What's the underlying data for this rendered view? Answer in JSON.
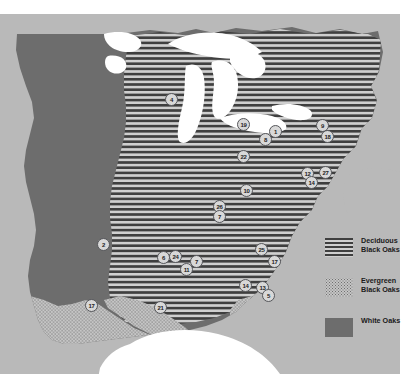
{
  "figure": {
    "type": "distribution-map",
    "region": "Eastern United States",
    "background_color": "#b9b9b9",
    "land_color": "#6d6d6d",
    "lake_color": "#ffffff"
  },
  "legend": {
    "items": [
      {
        "label_line1": "Deciduous",
        "label_line2": "Black Oaks",
        "pattern": "horizontal-stripes",
        "color": "#3f3f3f"
      },
      {
        "label_line1": "Evergreen",
        "label_line2": "Black Oaks",
        "pattern": "stipple-dots",
        "color": "#c4c4c4"
      },
      {
        "label_line1": "White Oaks",
        "label_line2": "",
        "pattern": "solid",
        "color": "#6d6d6d"
      }
    ]
  },
  "markers": [
    {
      "id": "4",
      "x": 171,
      "y": 99
    },
    {
      "id": "19",
      "x": 243,
      "y": 124
    },
    {
      "id": "1",
      "x": 275,
      "y": 131
    },
    {
      "id": "8",
      "x": 265,
      "y": 139
    },
    {
      "id": "9",
      "x": 322,
      "y": 125
    },
    {
      "id": "18",
      "x": 327,
      "y": 136
    },
    {
      "id": "22",
      "x": 243,
      "y": 156
    },
    {
      "id": "12",
      "x": 307,
      "y": 173
    },
    {
      "id": "27",
      "x": 325,
      "y": 172
    },
    {
      "id": "14",
      "x": 311,
      "y": 182
    },
    {
      "id": "10",
      "x": 246,
      "y": 190
    },
    {
      "id": "26",
      "x": 219,
      "y": 206
    },
    {
      "id": "7",
      "x": 219,
      "y": 216
    },
    {
      "id": "2",
      "x": 103,
      "y": 244
    },
    {
      "id": "25",
      "x": 261,
      "y": 249
    },
    {
      "id": "17",
      "x": 274,
      "y": 261
    },
    {
      "id": "6",
      "x": 163,
      "y": 257
    },
    {
      "id": "24",
      "x": 175,
      "y": 256
    },
    {
      "id": "7b",
      "x": 196,
      "y": 261,
      "label": "7"
    },
    {
      "id": "11",
      "x": 186,
      "y": 269
    },
    {
      "id": "14b",
      "x": 245,
      "y": 285,
      "label": "14"
    },
    {
      "id": "13",
      "x": 262,
      "y": 287
    },
    {
      "id": "5",
      "x": 268,
      "y": 295
    },
    {
      "id": "17b",
      "x": 91,
      "y": 305,
      "label": "17"
    },
    {
      "id": "21",
      "x": 160,
      "y": 307
    }
  ]
}
